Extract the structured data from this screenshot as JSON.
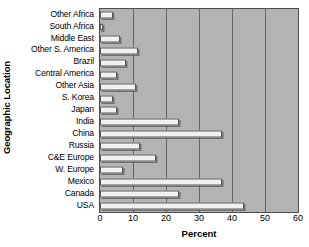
{
  "chart_data": {
    "type": "bar",
    "orientation": "horizontal",
    "title": "",
    "xlabel": "Percent",
    "ylabel": "Geographic Location",
    "xlim": [
      0,
      60
    ],
    "xticks": [
      0,
      10,
      20,
      30,
      40,
      50,
      60
    ],
    "grid": true,
    "legend": null,
    "plot_background": "#b3b3b3",
    "bar_fill": "#f2f2f2",
    "bar_edge": "#595959",
    "categories": [
      "Other Africa",
      "South Africa",
      "Middle East",
      "Other S. America",
      "Brazil",
      "Central America",
      "Other Asia",
      "S. Korea",
      "Japan",
      "India",
      "China",
      "Russia",
      "C&E Europe",
      "W. Europe",
      "Mexico",
      "Canada",
      "USA"
    ],
    "values": [
      4,
      1,
      6,
      11.5,
      8,
      5,
      11,
      4,
      5,
      24,
      37,
      12,
      17,
      7,
      37,
      24,
      43.5
    ]
  }
}
